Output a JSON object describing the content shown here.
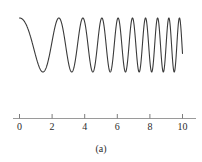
{
  "figure": {
    "caption": "(a)",
    "line_color": "#3a3a3a",
    "axis_color": "#9a9a9a",
    "background_color": "#ffffff",
    "tick_color": "#7d7d7d",
    "label_color": "#2b2b2b"
  },
  "chart_data": {
    "type": "line",
    "title": "",
    "subtitle": "",
    "xlabel": "",
    "ylabel": "",
    "annotations": [
      "(a)"
    ],
    "legend": [],
    "legend_position": "none",
    "grid": false,
    "xlim": [
      0,
      10.6
    ],
    "ylim": [
      -1.15,
      1.15
    ],
    "xticks": [
      0,
      2,
      4,
      6,
      8,
      10
    ],
    "xtick_labels": [
      "0",
      "2",
      "4",
      "6",
      "8",
      "10"
    ],
    "yticks": [],
    "ytick_labels": [],
    "axis_style": "single-horizontal-number-line",
    "series": [
      {
        "name": "chirp",
        "color": "#3a3a3a",
        "linewidth": 1.1,
        "formula": "cos(2*pi*(0.25*t + 0.068*t^2))",
        "amplitude": 1.0,
        "t_start": 0.0,
        "t_end": 10.0,
        "samples": 1400,
        "cycles_total": 16,
        "frequency_start_hz": 0.25,
        "frequency_end_hz": 1.61,
        "x": [
          0.0,
          0.25,
          0.5,
          0.75,
          1.0,
          1.25,
          1.5,
          1.75,
          2.0,
          2.25,
          2.5,
          2.75,
          3.0,
          3.25,
          3.5,
          3.75,
          4.0,
          4.25,
          4.5,
          4.75,
          5.0,
          5.25,
          5.5,
          5.75,
          6.0,
          6.25,
          6.5,
          6.75,
          7.0,
          7.25,
          7.5,
          7.75,
          8.0,
          8.25,
          8.5,
          8.75,
          9.0,
          9.25,
          9.5,
          9.75,
          10.0
        ],
        "y": [
          1.0,
          0.91,
          0.67,
          0.3,
          -0.11,
          -0.5,
          -0.8,
          -0.97,
          -1.0,
          -0.88,
          -0.62,
          -0.25,
          0.18,
          0.57,
          0.85,
          0.99,
          0.96,
          0.75,
          0.4,
          -0.03,
          -0.46,
          -0.8,
          -0.99,
          -0.97,
          -0.76,
          -0.37,
          0.1,
          0.55,
          0.88,
          1.0,
          0.88,
          0.55,
          0.06,
          -0.45,
          -0.84,
          -1.0,
          -0.89,
          -0.53,
          -0.01,
          0.52,
          0.9
        ]
      }
    ]
  }
}
